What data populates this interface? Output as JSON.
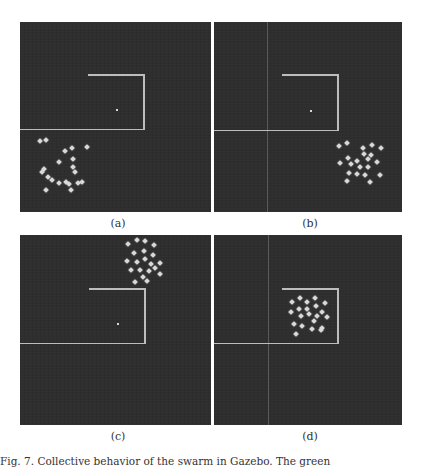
{
  "figure": {
    "caption": "Fig. 7.  Collective behavior of the swarm in Gazebo. The green",
    "panels": [
      {
        "id": "a",
        "label": "(a)"
      },
      {
        "id": "b",
        "label": "(b)"
      },
      {
        "id": "c",
        "label": "(c)"
      },
      {
        "id": "d",
        "label": "(d)"
      }
    ]
  },
  "colors": {
    "background": "#2e2e2e",
    "boundary_line": "#bdbdbd",
    "robot": "#d9d9d9",
    "page": "#ffffff"
  }
}
